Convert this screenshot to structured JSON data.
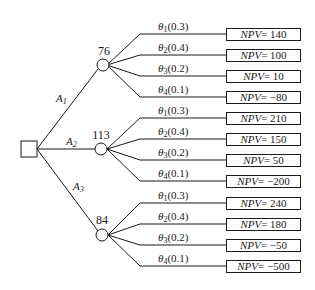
{
  "diagram": {
    "type": "decision-tree",
    "decision_node": {
      "shape": "square"
    },
    "alternatives": [
      {
        "label": "A",
        "index": "1",
        "expected_value": "76",
        "branches": [
          {
            "theta": "θ",
            "sub": "1",
            "prob": "(0.3)",
            "npv_label": "NPV",
            "npv": "= 140"
          },
          {
            "theta": "θ",
            "sub": "2",
            "prob": "(0.4)",
            "npv_label": "NPV",
            "npv": "= 100"
          },
          {
            "theta": "θ",
            "sub": "3",
            "prob": "(0.2)",
            "npv_label": "NPV",
            "npv": "= 10"
          },
          {
            "theta": "θ",
            "sub": "4",
            "prob": "(0.1)",
            "npv_label": "NPV",
            "npv": "= −80"
          }
        ]
      },
      {
        "label": "A",
        "index": "2",
        "expected_value": "113",
        "branches": [
          {
            "theta": "θ",
            "sub": "1",
            "prob": "(0.3)",
            "npv_label": "NPV",
            "npv": "= 210"
          },
          {
            "theta": "θ",
            "sub": "2",
            "prob": "(0.4)",
            "npv_label": "NPV",
            "npv": "= 150"
          },
          {
            "theta": "θ",
            "sub": "3",
            "prob": "(0.2)",
            "npv_label": "NPV",
            "npv": "= 50"
          },
          {
            "theta": "θ",
            "sub": "4",
            "prob": "(0.1)",
            "npv_label": "NPV",
            "npv": "= −200"
          }
        ]
      },
      {
        "label": "A",
        "index": "3",
        "expected_value": "84",
        "branches": [
          {
            "theta": "θ",
            "sub": "1",
            "prob": "(0.3)",
            "npv_label": "NPV",
            "npv": "= 240"
          },
          {
            "theta": "θ",
            "sub": "2",
            "prob": "(0.4)",
            "npv_label": "NPV",
            "npv": "= 180"
          },
          {
            "theta": "θ",
            "sub": "3",
            "prob": "(0.2)",
            "npv_label": "NPV",
            "npv": "= −50"
          },
          {
            "theta": "θ",
            "sub": "4",
            "prob": "(0.1)",
            "npv_label": "NPV",
            "npv": "= −500"
          }
        ]
      }
    ]
  }
}
